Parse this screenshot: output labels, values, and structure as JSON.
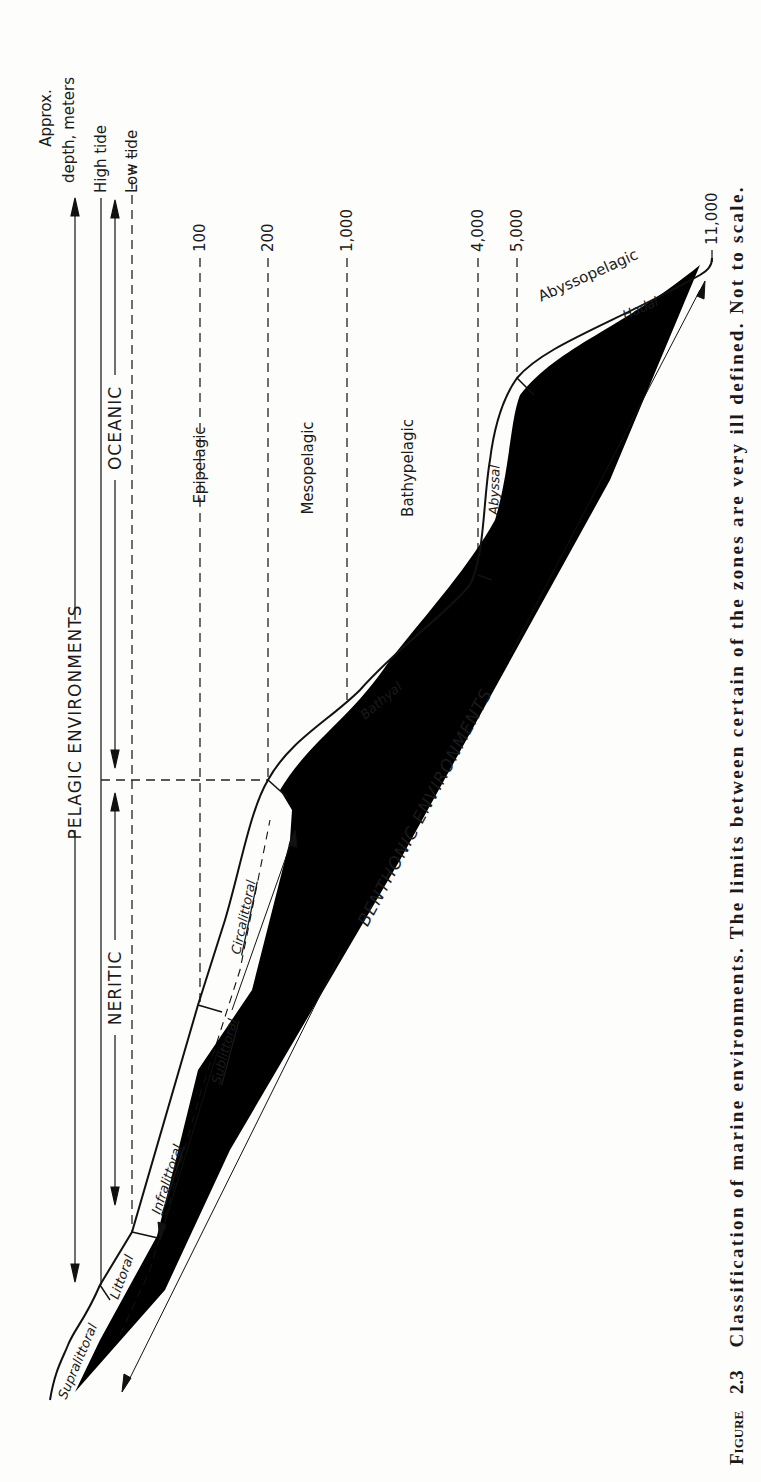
{
  "figure": {
    "number_prefix": "Figure",
    "number": "2.3",
    "caption": "Classification of marine environments. The limits between certain of the zones are very ill defined. Not to scale."
  },
  "depth_axis": {
    "header_line1": "Approx.",
    "header_line2": "depth, meters",
    "levels": [
      {
        "id": "high_tide",
        "label": "High tide",
        "style": "solid"
      },
      {
        "id": "low_tide",
        "label": "Low tide",
        "style": "dashed"
      },
      {
        "id": "d100",
        "label": "100",
        "style": "dashed"
      },
      {
        "id": "d200",
        "label": "200",
        "style": "dashed"
      },
      {
        "id": "d1000",
        "label": "1,000",
        "style": "dashed"
      },
      {
        "id": "d4000",
        "label": "4,000",
        "style": "dashed"
      },
      {
        "id": "d5000",
        "label": "5,000",
        "style": "dashed"
      },
      {
        "id": "d11000",
        "label": "11,000",
        "style": "dashed"
      }
    ]
  },
  "environments": {
    "pelagic": "PELAGIC ENVIRONMENTS",
    "neritic": "NERITIC",
    "oceanic": "OCEANIC",
    "benthonic": "BENTHONIC ENVIRONMENTS"
  },
  "pelagic_zones": {
    "epipelagic": "Epipelagic",
    "mesopelagic": "Mesopelagic",
    "bathypelagic": "Bathypelagic",
    "abyssopelagic": "Abyssopelagic"
  },
  "benthic_zones": {
    "supralittoral": "Supralittoral",
    "littoral": "Littoral",
    "infralittoral": "Infralittoral",
    "sublittoral": "Sublittoral",
    "circalittoral": "Circalittoral",
    "bathyal": "Bathyal",
    "abyssal": "Abyssal",
    "hadal": "Hadal"
  }
}
